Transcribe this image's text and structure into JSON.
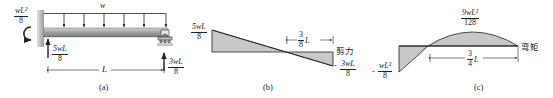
{
  "panels": {
    "a": {
      "caption": "(a)",
      "load_label": "w",
      "moment": {
        "num": "wL²",
        "den": "8"
      },
      "left_reaction": {
        "num": "5wL",
        "den": "8"
      },
      "right_reaction": {
        "num": "3wL",
        "den": "8"
      },
      "span_label": "L"
    },
    "b": {
      "caption": "(b)",
      "title": "剪力",
      "max_value": {
        "num": "5wL",
        "den": "8"
      },
      "min_sign": "-",
      "min_value": {
        "num": "3wL",
        "den": "8"
      },
      "dimension": {
        "num": "3",
        "den": "8",
        "suffix": "L"
      }
    },
    "c": {
      "caption": "(c)",
      "title": "弯矩",
      "max_value": {
        "num": "9wL²",
        "den": "128"
      },
      "min_sign": "-",
      "min_value": {
        "num": "wL²",
        "den": "8"
      },
      "dimension": {
        "num": "3",
        "den": "4",
        "suffix": "L"
      }
    }
  },
  "colors": {
    "fill": "#c8c8c8",
    "line": "#222222",
    "beam": "#a8a8a8"
  }
}
